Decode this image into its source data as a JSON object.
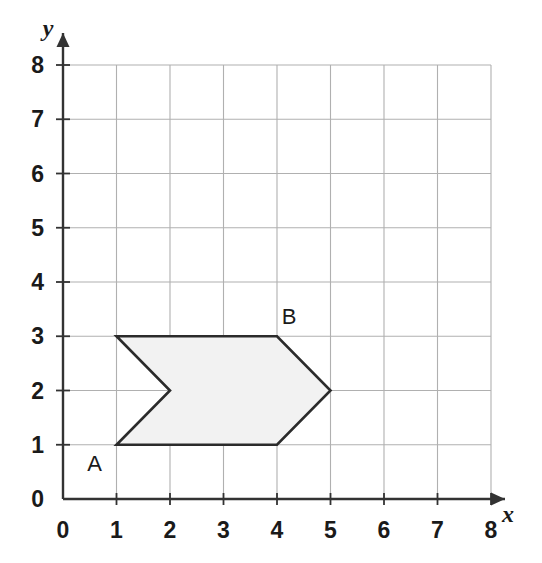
{
  "chart_data": {
    "type": "scatter",
    "title": "",
    "xlabel": "x",
    "ylabel": "y",
    "xlim": [
      0,
      8
    ],
    "ylim": [
      0,
      8
    ],
    "x_ticks": [
      "0",
      "1",
      "2",
      "3",
      "4",
      "5",
      "6",
      "7",
      "8"
    ],
    "y_ticks": [
      "0",
      "1",
      "2",
      "3",
      "4",
      "5",
      "6",
      "7",
      "8"
    ],
    "grid": true,
    "legend": "none",
    "shapes": [
      {
        "name": "chevron-polygon",
        "kind": "polygon",
        "fill": "#f2f2f2",
        "stroke": "#2b2b2b",
        "vertices": [
          {
            "x": 1,
            "y": 3,
            "label": ""
          },
          {
            "x": 4,
            "y": 3,
            "label": "B"
          },
          {
            "x": 5,
            "y": 2,
            "label": ""
          },
          {
            "x": 4,
            "y": 1,
            "label": ""
          },
          {
            "x": 1,
            "y": 1,
            "label": "A"
          },
          {
            "x": 2,
            "y": 2,
            "label": ""
          }
        ]
      }
    ],
    "annotations": [
      {
        "text": "A",
        "x": 1,
        "y": 1,
        "position": "below-left"
      },
      {
        "text": "B",
        "x": 4,
        "y": 3,
        "position": "above-right"
      }
    ]
  },
  "axes": {
    "x_name": "x",
    "y_name": "y",
    "grid_color": "#b0b0b0",
    "axis_color": "#333333"
  },
  "labels": {
    "vertex_a": "A",
    "vertex_b": "B"
  }
}
